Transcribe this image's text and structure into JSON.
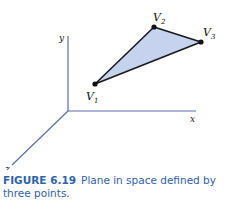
{
  "figure": {
    "axes": {
      "x_label": "x",
      "y_label": "y",
      "z_label": "z",
      "color": "#5a6fa8"
    },
    "vertices": [
      {
        "name": "V",
        "sub": "1"
      },
      {
        "name": "V",
        "sub": "2"
      },
      {
        "name": "V",
        "sub": "3"
      }
    ],
    "plane_fill": "#c5d3ee",
    "edge_color": "#1a1a1a"
  },
  "caption": {
    "number": "FIGURE 6.19",
    "text": "Plane in space defined by three points."
  }
}
